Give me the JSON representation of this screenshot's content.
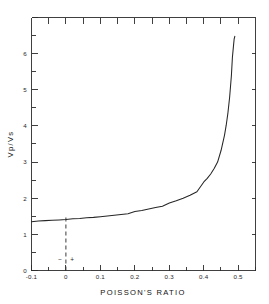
{
  "chart_data": {
    "type": "line",
    "title": "",
    "xlabel": "POISSON'S RATIO",
    "ylabel": "Vp/Vs",
    "xlim": [
      -0.1,
      0.55
    ],
    "ylim": [
      0,
      7
    ],
    "grid": false,
    "legend": null,
    "x_major_ticks": [
      -0.1,
      0,
      0.1,
      0.2,
      0.3,
      0.4,
      0.5
    ],
    "x_major_tick_labels": [
      "-0.1",
      "0",
      "0.1",
      "0.2",
      "0.3",
      "0.4",
      "0.5"
    ],
    "x_minor_ticks": [
      -0.05,
      0.05,
      0.15,
      0.25,
      0.35,
      0.45,
      0.55
    ],
    "y_major_ticks": [
      0,
      1,
      2,
      3,
      4,
      5,
      6,
      7
    ],
    "y_major_tick_labels": [
      "0",
      "1",
      "2",
      "3",
      "4",
      "5",
      "6",
      ""
    ],
    "y_minor_ticks": [
      0.5,
      1.5,
      2.5,
      3.5,
      4.5,
      5.5,
      6.5
    ],
    "series": [
      {
        "name": "Vp/Vs = sqrt(2(1-v)/(1-2v))",
        "x": [
          -0.1,
          -0.08,
          -0.06,
          -0.04,
          -0.02,
          0.0,
          0.02,
          0.04,
          0.06,
          0.08,
          0.1,
          0.12,
          0.14,
          0.16,
          0.18,
          0.2,
          0.22,
          0.24,
          0.26,
          0.28,
          0.3,
          0.32,
          0.34,
          0.36,
          0.38,
          0.4,
          0.41,
          0.42,
          0.43,
          0.44,
          0.45,
          0.46,
          0.465,
          0.47,
          0.475,
          0.48,
          0.483,
          0.486,
          0.488,
          0.49
        ],
        "y": [
          1.35,
          1.37,
          1.38,
          1.39,
          1.4,
          1.41,
          1.43,
          1.44,
          1.46,
          1.47,
          1.49,
          1.51,
          1.53,
          1.55,
          1.57,
          1.63,
          1.66,
          1.7,
          1.74,
          1.78,
          1.87,
          1.93,
          2.0,
          2.08,
          2.18,
          2.45,
          2.55,
          2.67,
          2.82,
          3.0,
          3.32,
          3.74,
          4.02,
          4.36,
          4.8,
          5.39,
          5.9,
          6.2,
          6.4,
          6.48
        ]
      }
    ],
    "annotations": [
      {
        "name": "zero-reference-line",
        "type": "vertical-dashed-line",
        "x": 0,
        "y_from": 0,
        "y_to": 1.55
      },
      {
        "name": "negative-sign",
        "type": "text",
        "text": "−",
        "x": -0.017,
        "y": 0.28
      },
      {
        "name": "positive-sign",
        "type": "text",
        "text": "+",
        "x": 0.018,
        "y": 0.28
      }
    ]
  }
}
